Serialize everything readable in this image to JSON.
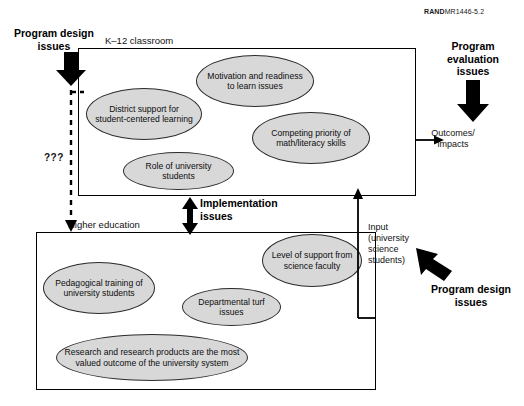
{
  "credit": {
    "brand": "RAND",
    "ref": "MR1446-5.2"
  },
  "boxes": {
    "k12": {
      "caption": "K–12 classroom"
    },
    "higher_ed": {
      "caption": "Higher education"
    }
  },
  "k12_factors": [
    {
      "id": "motivation",
      "label": "Motivation and readiness to learn issues"
    },
    {
      "id": "district-support",
      "label": "District support for student-centered learning"
    },
    {
      "id": "competing-priority",
      "label": "Competing priority of math/literacy skills"
    },
    {
      "id": "role-of-university-students",
      "label": "Role of university students"
    }
  ],
  "higher_ed_factors": [
    {
      "id": "level-of-support",
      "label": "Level of support from science faculty"
    },
    {
      "id": "pedagogical-training",
      "label": "Pedagogical training of university students"
    },
    {
      "id": "departmental-turf",
      "label": "Departmental turf issues"
    },
    {
      "id": "research-products",
      "label": "Research and research products are the most valued outcome of the university system"
    }
  ],
  "annotations": {
    "program_design_top": "Program design issues",
    "program_design_top_line1": "Program design",
    "program_design_top_line2": "issues",
    "program_evaluation": "Program evaluation issues",
    "implementation": "Implementation issues",
    "program_design_right": "Program design issues",
    "outcomes": "Outcomes/ impacts",
    "input": "Input (university science students)",
    "unknown": "???"
  },
  "colors": {
    "ellipse_fill": "#d8d8d8",
    "ellipse_stroke": "#2b2b2b",
    "box_stroke": "#000000",
    "text": "#111111",
    "background": "#ffffff"
  }
}
